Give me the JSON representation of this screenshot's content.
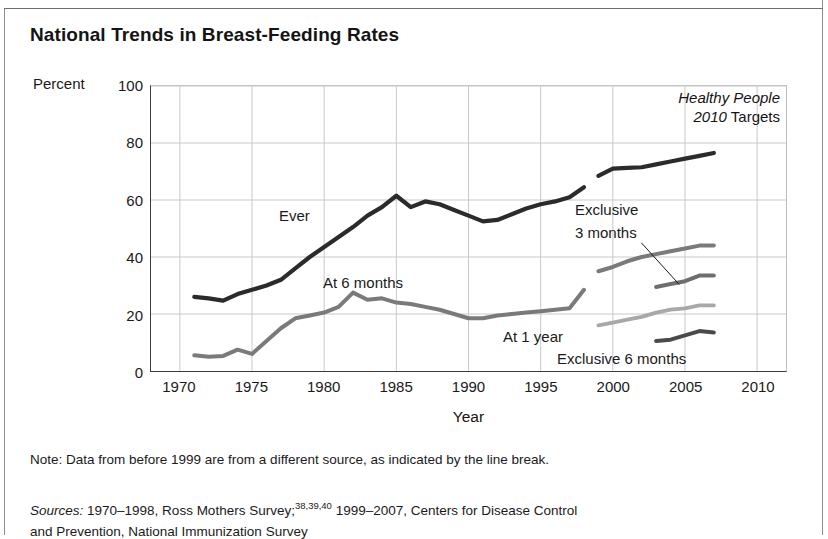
{
  "figure": {
    "title": "National Trends in Breast-Feeding Rates",
    "note": "Note: Data from before 1999 are from a different source, as indicated by the line break.",
    "sources_label": "Sources:",
    "sources_text_1": "1970–1998, Ross Mothers Survey;",
    "sources_sup_1": "38,39,40",
    "sources_text_2": " 1999–2007, Centers for Disease Control",
    "sources_text_3": "and Prevention, National Immunization Survey"
  },
  "legend_box": {
    "line1_italic": "Healthy People",
    "line2_italic": "2010",
    "line2_plain": " Targets"
  },
  "annotations": [
    {
      "name": "ever",
      "text": "Ever"
    },
    {
      "name": "at-6-months",
      "text": "At 6 months"
    },
    {
      "name": "at-1-year",
      "text": "At 1 year"
    },
    {
      "name": "exclusive-3-months-line1",
      "text": "Exclusive"
    },
    {
      "name": "exclusive-3-months-line2",
      "text": "3 months"
    },
    {
      "name": "exclusive-6-months",
      "text": "Exclusive 6 months"
    }
  ],
  "chart_data": {
    "type": "line",
    "title": "National Trends in Breast-Feeding Rates",
    "xlabel": "Year",
    "ylabel": "Percent",
    "ylim": [
      0,
      100
    ],
    "xlim": [
      1968,
      2012
    ],
    "yticks": [
      0,
      20,
      40,
      60,
      80,
      100
    ],
    "xticks": [
      1970,
      1975,
      1980,
      1985,
      1990,
      1995,
      2000,
      2005,
      2010
    ],
    "grid": true,
    "legend_position": "in-plot-labels",
    "colors": {
      "ever": "#2b2b2b",
      "at_6_months": "#7a7a7a",
      "at_1_year": "#a8a8a8",
      "exclusive_3_months": "#6e6e6e",
      "exclusive_6_months": "#4a4a4a",
      "gridline": "#c9c9c9",
      "axis": "#3b3b3b"
    },
    "series": [
      {
        "name": "Ever",
        "color": "#2b2b2b",
        "segments": [
          {
            "source": "Ross Mothers Survey",
            "x": [
              1971,
              1972,
              1973,
              1974,
              1975,
              1976,
              1977,
              1978,
              1979,
              1980,
              1981,
              1982,
              1983,
              1984,
              1985,
              1986,
              1987,
              1988,
              1989,
              1990,
              1991,
              1992,
              1993,
              1994,
              1995,
              1996,
              1997,
              1998
            ],
            "y": [
              26.0,
              25.5,
              24.7,
              27.0,
              28.5,
              30.0,
              32.0,
              36.0,
              40.0,
              43.5,
              47.0,
              50.5,
              54.5,
              57.5,
              61.5,
              57.5,
              59.5,
              58.5,
              56.5,
              54.5,
              52.5,
              53.0,
              55.0,
              57.0,
              58.5,
              59.5,
              61.0,
              64.5
            ]
          },
          {
            "source": "National Immunization Survey",
            "x": [
              1999,
              2000,
              2001,
              2002,
              2003,
              2004,
              2005,
              2006,
              2007
            ],
            "y": [
              68.5,
              71.0,
              71.3,
              71.5,
              72.5,
              73.5,
              74.5,
              75.5,
              76.5
            ]
          }
        ]
      },
      {
        "name": "At 6 months",
        "color": "#7a7a7a",
        "segments": [
          {
            "source": "Ross Mothers Survey",
            "x": [
              1971,
              1972,
              1973,
              1974,
              1975,
              1976,
              1977,
              1978,
              1979,
              1980,
              1981,
              1982,
              1983,
              1984,
              1985,
              1986,
              1987,
              1988,
              1989,
              1990,
              1991,
              1992,
              1993,
              1994,
              1995,
              1996,
              1997,
              1998
            ],
            "y": [
              5.5,
              5.0,
              5.3,
              7.5,
              6.0,
              10.5,
              15.0,
              18.5,
              19.5,
              20.5,
              22.5,
              27.5,
              25.0,
              25.5,
              24.0,
              23.5,
              22.5,
              21.5,
              20.0,
              18.5,
              18.5,
              19.5,
              20.0,
              20.5,
              21.0,
              21.5,
              22.0,
              28.5
            ]
          },
          {
            "source": "National Immunization Survey",
            "x": [
              1999,
              2000,
              2001,
              2002,
              2003,
              2004,
              2005,
              2006,
              2007
            ],
            "y": [
              35.0,
              36.5,
              38.5,
              40.0,
              41.0,
              42.0,
              43.0,
              44.0,
              44.0
            ]
          }
        ]
      },
      {
        "name": "At 1 year",
        "color": "#a8a8a8",
        "segments": [
          {
            "source": "National Immunization Survey",
            "x": [
              1999,
              2000,
              2001,
              2002,
              2003,
              2004,
              2005,
              2006,
              2007
            ],
            "y": [
              16.0,
              17.0,
              18.0,
              19.0,
              20.5,
              21.5,
              22.0,
              23.0,
              23.0
            ]
          }
        ]
      },
      {
        "name": "Exclusive 3 months",
        "color": "#6e6e6e",
        "segments": [
          {
            "source": "National Immunization Survey",
            "x": [
              2003,
              2004,
              2005,
              2006,
              2007
            ],
            "y": [
              29.5,
              30.5,
              31.5,
              33.5,
              33.5
            ]
          }
        ]
      },
      {
        "name": "Exclusive 6 months",
        "color": "#4a4a4a",
        "segments": [
          {
            "source": "National Immunization Survey",
            "x": [
              2003,
              2004,
              2005,
              2006,
              2007
            ],
            "y": [
              10.5,
              11.0,
              12.5,
              14.0,
              13.5
            ]
          }
        ]
      }
    ],
    "targets": [
      {
        "name": "Ever",
        "year": 2010,
        "value": 75,
        "color": "#2b2b2b",
        "size": 22
      },
      {
        "name": "At 6 months",
        "year": 2010,
        "value": 50,
        "color": "#5f5f5f",
        "size": 19
      },
      {
        "name": "Exclusive 3 months",
        "year": 2010,
        "value": 40,
        "color": "#a3a3a3",
        "size": 19
      },
      {
        "name": "At 1 year",
        "year": 2010,
        "value": 25,
        "color": "#b5b5b5",
        "size": 19
      },
      {
        "name": "Exclusive 6 months",
        "year": 2010,
        "value": 17,
        "color": "#5f5f5f",
        "size": 19
      }
    ],
    "break_note": "Data from before 1999 are from a different source, as indicated by the line break."
  }
}
